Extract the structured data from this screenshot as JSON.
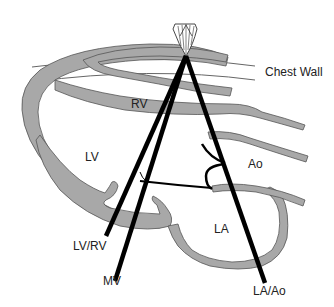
{
  "diagram": {
    "type": "echocardiography-m-mode-beam-positions",
    "labels": {
      "chest_wall": "Chest Wall",
      "rv": "RV",
      "lv": "LV",
      "ao": "Ao",
      "la": "LA",
      "beam_lv_rv": "LV/RV",
      "beam_mv": "MV",
      "beam_la_ao": "LA/Ao"
    },
    "colors": {
      "tissue": "#a8a8a8",
      "beam": "#000000",
      "outline": "#555555",
      "background": "#ffffff"
    }
  }
}
